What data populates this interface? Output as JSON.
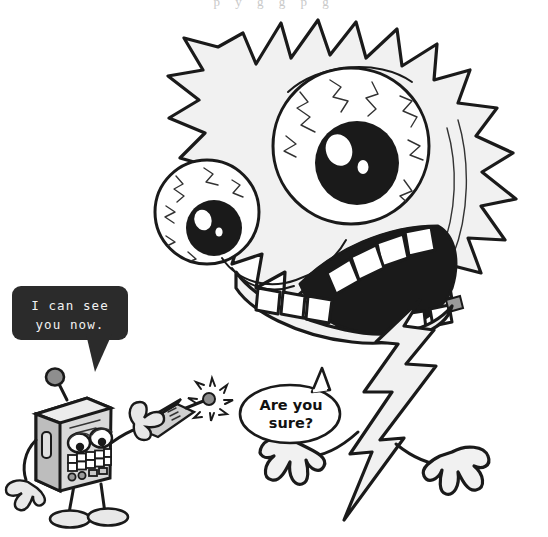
{
  "page": {
    "background_color": "#ffffff",
    "width": 548,
    "height": 537,
    "cut_off_header_text": "p y g g p g"
  },
  "palette": {
    "ink": "#1a1a1a",
    "paper": "#ffffff",
    "monster_fill": "#f2f2f2",
    "monster_shade": "#e6e6e6",
    "robot_body": "#d8d8d8",
    "robot_body_dark": "#b8b8b8",
    "robot_limb": "#1a1a1a",
    "bubble_dark": "#2b2b2b",
    "bubble_dark_text": "#f2f2f2"
  },
  "characters": {
    "monster": {
      "name": "spiky-monster",
      "description": "Large spiky blob monster with two bloodshot eyes, wide toothy grin, lightning-bolt tail and two thin arms with hands",
      "eyes": [
        {
          "name": "monster-eye-large",
          "bloodshot": true,
          "highlights": 2
        },
        {
          "name": "monster-eye-small",
          "bloodshot": true,
          "highlights": 2
        }
      ],
      "teeth_upper": 6,
      "teeth_lower": 4,
      "hands": 2
    },
    "robot": {
      "name": "boxy-robot",
      "description": "Gray boxy robot with ball-tipped antenna, two oval eyes, grid of teeth, button row, thin black arms and legs, holding a remote transmitter",
      "teeth_grid": {
        "rows": 2,
        "columns": 5
      },
      "buttons": 5,
      "antenna": true,
      "device": {
        "name": "remote-transmitter",
        "emitting_signal": true
      }
    }
  },
  "speech_bubbles": [
    {
      "id": "robot-bubble",
      "speaker": "boxy-robot",
      "style": "dark-rounded-rect",
      "line1": "I can see",
      "line2": "you now.",
      "text": "I can see you now.",
      "fill": "#2b2b2b",
      "text_color": "#f2f2f2"
    },
    {
      "id": "monster-bubble",
      "speaker": "spiky-monster",
      "style": "white-oval",
      "line1": "Are you",
      "line2": "sure?",
      "text": "Are you sure?",
      "fill": "#ffffff",
      "text_color": "#111111"
    }
  ]
}
